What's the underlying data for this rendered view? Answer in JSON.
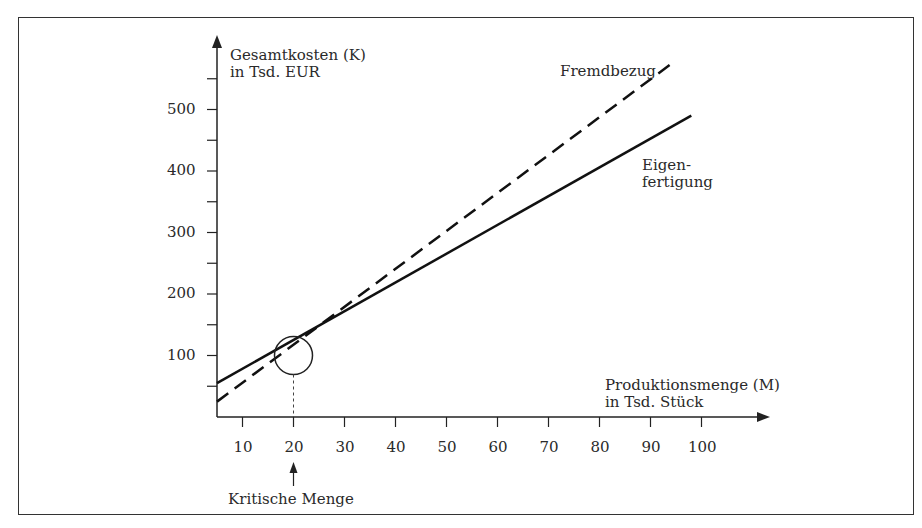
{
  "chart_data": {
    "type": "line",
    "title": "",
    "xlabel": "Produktionsmenge (M) in Tsd. Stück",
    "ylabel": "Gesamtkosten (K) in Tsd. EUR",
    "x_ticks": [
      10,
      20,
      30,
      40,
      50,
      60,
      70,
      80,
      90,
      100
    ],
    "y_ticks": [
      100,
      200,
      300,
      400,
      500
    ],
    "xlim": [
      5,
      110
    ],
    "ylim": [
      0,
      600
    ],
    "grid": false,
    "approximate": true,
    "note": "Series are linear fits anchored on the verified crossing at (20, 100); x-axis origin verified at M=5; y origin/scale and line endpoints estimated from the overview.",
    "series": [
      {
        "name": "Fremdbezug",
        "style": "dashed",
        "x": [
          5,
          20,
          95
        ],
        "y": [
          25,
          100,
          580
        ]
      },
      {
        "name": "Eigenfertigung",
        "style": "solid",
        "x": [
          5,
          20,
          98
        ],
        "y": [
          55,
          100,
          490
        ]
      }
    ],
    "annotations": [
      {
        "text": "Kritische Menge",
        "x": 20,
        "y": 100,
        "marker": "circle"
      }
    ]
  },
  "labels": {
    "y_axis_line1": "Gesamtkosten (K)",
    "y_axis_line2": "in Tsd. EUR",
    "x_axis_line1": "Produktionsmenge (M)",
    "x_axis_line2": "in Tsd. Stück",
    "fremdbezug": "Fremdbezug",
    "eigen_line1": "Eigen-",
    "eigen_line2": "fertigung",
    "kritische_menge": "Kritische Menge"
  },
  "x_tick_labels": [
    "10",
    "20",
    "30",
    "40",
    "50",
    "60",
    "70",
    "80",
    "90",
    "100"
  ],
  "y_tick_labels": [
    "100",
    "200",
    "300",
    "400",
    "500"
  ]
}
